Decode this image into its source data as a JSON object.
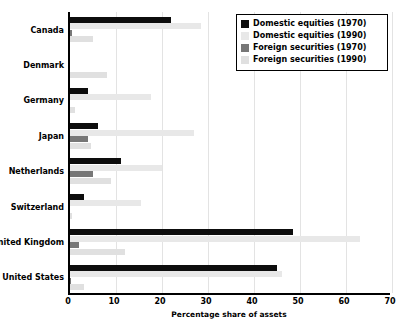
{
  "chart_data": {
    "type": "bar",
    "orientation": "horizontal",
    "title": "",
    "xlabel": "Percentage share of assets",
    "ylabel": "",
    "xlim": [
      0,
      70
    ],
    "xticks": [
      0,
      10,
      20,
      30,
      40,
      50,
      60,
      70
    ],
    "grid": true,
    "legend_position": "top-right",
    "categories": [
      "Canada",
      "Denmark",
      "Germany",
      "Japan",
      "Netherlands",
      "Switzerland",
      "United Kingdom",
      "United States"
    ],
    "series": [
      {
        "name": "Domestic equities (1970)",
        "color": "#0d0d0d",
        "values": [
          22.0,
          0.0,
          4.0,
          6.0,
          11.0,
          3.0,
          48.5,
          45.0
        ]
      },
      {
        "name": "Domestic equities (1990)",
        "color": "#e8e8e8",
        "values": [
          28.5,
          0.0,
          17.5,
          27.0,
          20.0,
          15.5,
          63.0,
          46.0
        ]
      },
      {
        "name": "Foreign securities (1970)",
        "color": "#777777",
        "values": [
          0.5,
          0.0,
          0.0,
          4.0,
          5.0,
          0.0,
          2.0,
          0.3
        ]
      },
      {
        "name": "Foreign securities (1990)",
        "color": "#e0e0e0",
        "values": [
          5.0,
          8.0,
          1.0,
          4.5,
          9.0,
          0.5,
          12.0,
          3.0
        ]
      }
    ]
  },
  "legend": {
    "items": [
      {
        "label": "Domestic equities (1970)",
        "color": "#0d0d0d"
      },
      {
        "label": "Domestic equities (1990)",
        "color": "#e8e8e8"
      },
      {
        "label": "Foreign securities (1970)",
        "color": "#777777"
      },
      {
        "label": "Foreign securities (1990)",
        "color": "#e0e0e0"
      }
    ]
  },
  "xaxis": {
    "title": "Percentage share of assets",
    "ticks": [
      "0",
      "10",
      "20",
      "30",
      "40",
      "50",
      "60",
      "70"
    ]
  }
}
